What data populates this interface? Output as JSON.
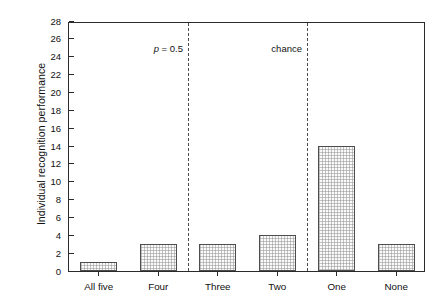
{
  "chart_data": {
    "type": "bar",
    "title": "",
    "xlabel": "",
    "ylabel": "Individual recognition performance",
    "categories": [
      "All five",
      "Four",
      "Three",
      "Two",
      "One",
      "None"
    ],
    "values": [
      1,
      3,
      3,
      4,
      14,
      3
    ],
    "ylim": [
      0,
      28
    ],
    "ytick_values": [
      0,
      2,
      4,
      6,
      8,
      10,
      12,
      14,
      16,
      18,
      20,
      22,
      24,
      26,
      28
    ],
    "ytick_labels": [
      "0",
      "2",
      "4",
      "6",
      "8",
      "10",
      "12",
      "14",
      "16",
      "18",
      "20",
      "22",
      "24",
      "26",
      "28"
    ],
    "grid": false,
    "legend": "none",
    "bar_fill": "#fafafa",
    "bar_edge": "#4d4d4d",
    "bar_hatch": "fine-checker-gray",
    "axis_color": "#2b2b2b",
    "annotations": [
      {
        "name": "p-threshold-line",
        "label_plain": "p = 0.5",
        "label_italic_part": "p",
        "label_rest": " = 0.5",
        "after_category_index": 1,
        "line_style": "dashed"
      },
      {
        "name": "chance-line",
        "label_plain": "chance",
        "label_italic_part": "",
        "label_rest": "chance",
        "after_category_index": 3,
        "line_style": "dashed"
      }
    ]
  }
}
